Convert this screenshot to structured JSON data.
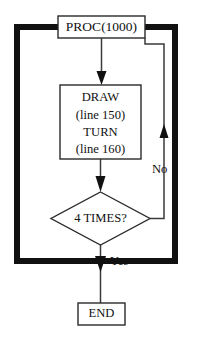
{
  "diagram": {
    "type": "flowchart",
    "colors": {
      "background": "#ffffff",
      "node_stroke": "#2a2a2a",
      "node_fill": "#ffffff",
      "connector": "#3a3a3a",
      "loop_border": "#111111",
      "text": "#111111"
    },
    "nodes": {
      "start": {
        "shape": "rectangle",
        "label": "PROC(1000)"
      },
      "process": {
        "shape": "rectangle",
        "line1": "DRAW",
        "line2": "(line 150)",
        "line3": "TURN",
        "line4": "(line 160)"
      },
      "decision": {
        "shape": "diamond",
        "label": "4 TIMES?"
      },
      "end": {
        "shape": "rectangle",
        "label": "END"
      }
    },
    "edges": {
      "no_label": "No",
      "yes_label": "Yes"
    }
  }
}
